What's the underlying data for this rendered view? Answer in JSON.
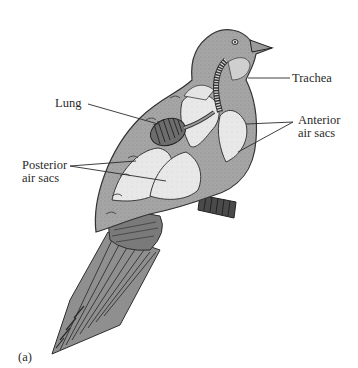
{
  "figure": {
    "panel_label": "(a)",
    "labels": {
      "trachea": "Trachea",
      "lung": "Lung",
      "anterior_line1": "Anterior",
      "anterior_line2": "air sacs",
      "posterior_line1": "Posterior",
      "posterior_line2": "air sacs"
    },
    "colors": {
      "body": "#a9a9a9",
      "air_sac": "#e6e6e6",
      "outline": "#3a3a3a",
      "text": "#2a2a2a",
      "background": "#ffffff"
    }
  }
}
